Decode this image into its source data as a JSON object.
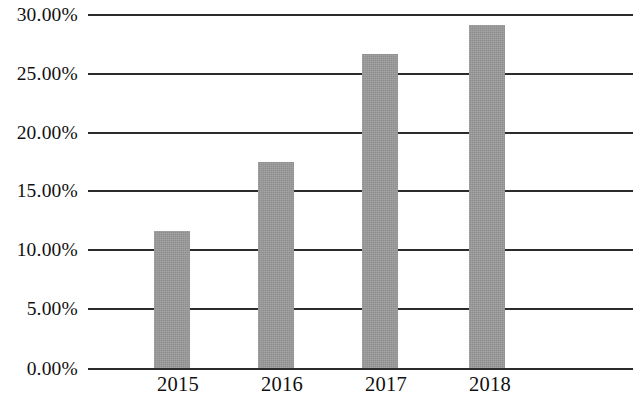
{
  "chart_data": {
    "type": "bar",
    "title": "",
    "subtitle": "",
    "xlabel": "",
    "ylabel": "",
    "categories": [
      "2015",
      "2016",
      "2017",
      "2018"
    ],
    "values": [
      11.6,
      17.5,
      26.6,
      29.1
    ],
    "value_labels": [
      "11.60%",
      "17.50%",
      "26.60%",
      "29.10%"
    ],
    "series": [
      {
        "name": "",
        "values": [
          11.6,
          17.5,
          26.6,
          29.1
        ]
      }
    ],
    "ylim": [
      0,
      30
    ],
    "ytick_values": [
      30,
      25,
      20,
      15,
      10,
      5,
      0
    ],
    "ytick_labels": [
      "30.00%",
      "25.00%",
      "20.00%",
      "15.00%",
      "10.00%",
      "5.00%",
      "0.00%"
    ],
    "xtick_labels": [
      "2015",
      "2016",
      "2017",
      "2018"
    ],
    "grid": "horizontal",
    "legend": "none",
    "annotations": [],
    "colors": {
      "bar_fill": "#9a9a9a",
      "gridline": "#2b2b2b",
      "axis_text": "#111111",
      "background": "#ffffff"
    }
  }
}
